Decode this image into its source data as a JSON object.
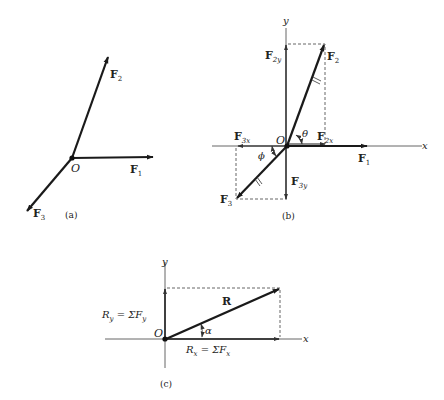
{
  "figure": {
    "panels": [
      {
        "id": "a",
        "caption": "(a)",
        "origin_label": "O",
        "vectors": [
          {
            "name": "F1",
            "label_main": "F",
            "label_sub": "1"
          },
          {
            "name": "F2",
            "label_main": "F",
            "label_sub": "2"
          },
          {
            "name": "F3",
            "label_main": "F",
            "label_sub": "3"
          }
        ]
      },
      {
        "id": "b",
        "caption": "(b)",
        "origin_label": "O",
        "x_axis_label": "x",
        "y_axis_label": "y",
        "angle_labels": {
          "theta": "θ",
          "phi": "ϕ"
        },
        "vectors": [
          {
            "name": "F1",
            "label_main": "F",
            "label_sub": "1"
          },
          {
            "name": "F2",
            "label_main": "F",
            "label_sub": "2"
          },
          {
            "name": "F3",
            "label_main": "F",
            "label_sub": "3"
          },
          {
            "name": "F2x",
            "label_main": "F",
            "label_sub": "2x"
          },
          {
            "name": "F2y",
            "label_main": "F",
            "label_sub": "2y"
          },
          {
            "name": "F3x",
            "label_main": "F",
            "label_sub": "3x"
          },
          {
            "name": "F3y",
            "label_main": "F",
            "label_sub": "3y"
          }
        ]
      },
      {
        "id": "c",
        "caption": "(c)",
        "origin_label": "O",
        "x_axis_label": "x",
        "y_axis_label": "y",
        "angle_label": "α",
        "resultant_label": "R",
        "ry_label": "R",
        "ry_sub": "y",
        "ry_eq": " = ΣF",
        "ry_eq_sub": "y",
        "rx_label": "R",
        "rx_sub": "x",
        "rx_eq": " = ΣF",
        "rx_eq_sub": "x"
      }
    ]
  }
}
